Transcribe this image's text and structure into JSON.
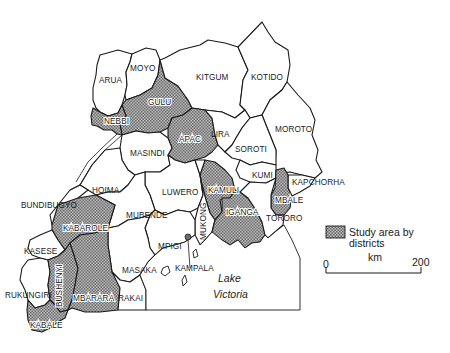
{
  "map": {
    "country": "Uganda",
    "districts": [
      {
        "id": "arua",
        "name": "ARUA",
        "study": false
      },
      {
        "id": "moyo",
        "name": "MOYO",
        "study": false
      },
      {
        "id": "kitgum",
        "name": "KITGUM",
        "study": false
      },
      {
        "id": "kotido",
        "name": "KOTIDO",
        "study": false
      },
      {
        "id": "gulu",
        "name": "GULU",
        "study": true
      },
      {
        "id": "nebbi",
        "name": "NEBBI",
        "study": true
      },
      {
        "id": "apac",
        "name": "APAC",
        "study": true
      },
      {
        "id": "lira",
        "name": "LIRA",
        "study": false
      },
      {
        "id": "moroto",
        "name": "MOROTO",
        "study": false
      },
      {
        "id": "masindi",
        "name": "MASINDI",
        "study": false
      },
      {
        "id": "soroti",
        "name": "SOROTI",
        "study": false
      },
      {
        "id": "kumi",
        "name": "KUMI",
        "study": false
      },
      {
        "id": "kapchorha",
        "name": "KAPCHORHA",
        "study": false
      },
      {
        "id": "hoima",
        "name": "HOIMA",
        "study": false
      },
      {
        "id": "luwero",
        "name": "LUWERO",
        "study": false
      },
      {
        "id": "kamuli",
        "name": "KAMULI",
        "study": true
      },
      {
        "id": "mbale",
        "name": "MBALE",
        "study": true
      },
      {
        "id": "bundibugyo",
        "name": "BUNDIBUGYO",
        "study": false
      },
      {
        "id": "mubende",
        "name": "MUBENDE",
        "study": false
      },
      {
        "id": "mukono",
        "name": "MUKONG",
        "study": false
      },
      {
        "id": "iganga",
        "name": "IGANGA",
        "study": true
      },
      {
        "id": "tororo",
        "name": "TORORO",
        "study": false
      },
      {
        "id": "kabarole",
        "name": "KABAROLE",
        "study": true
      },
      {
        "id": "kasese",
        "name": "KASESE",
        "study": false
      },
      {
        "id": "mpigi",
        "name": "MPIGI",
        "study": false
      },
      {
        "id": "masaka",
        "name": "MASAKA",
        "study": false
      },
      {
        "id": "kampala",
        "name": "KAMPALA",
        "study": false
      },
      {
        "id": "rukungiri",
        "name": "RUKUNGIRI",
        "study": false
      },
      {
        "id": "bushenyi",
        "name": "BUSHENYI",
        "study": true
      },
      {
        "id": "mbarara",
        "name": "MBARARA",
        "study": true
      },
      {
        "id": "rakai",
        "name": "RAKAI",
        "study": false
      },
      {
        "id": "kabale",
        "name": "KABALE",
        "study": true
      }
    ],
    "lake": {
      "line1": "Lake",
      "line2": "Victoria"
    }
  },
  "legend": {
    "swatch_label_line1": "Study area by",
    "swatch_label_line2": "districts",
    "scale_unit": "km",
    "scale_min": "0",
    "scale_max": "200"
  },
  "colors": {
    "outline": "#1a1a1a",
    "study_fill": "#9a9a9a",
    "background": "#ffffff"
  }
}
